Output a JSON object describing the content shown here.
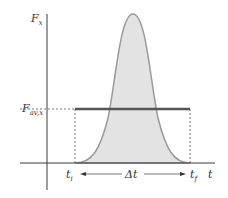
{
  "diagram": {
    "labels": {
      "y_axis": "F",
      "y_axis_sub": "x",
      "x_axis": "t",
      "avg_force": "F",
      "avg_force_sub": "av,x",
      "t_initial": "t",
      "t_initial_sub": "i",
      "t_final": "t",
      "t_final_sub": "f",
      "delta_t": "Δt"
    },
    "colors": {
      "axis": "#3a3a3a",
      "curve_fill": "#e3e3e3",
      "curve_stroke": "#9a9a9a",
      "avg_line": "#555555",
      "dashed": "#555555"
    }
  }
}
